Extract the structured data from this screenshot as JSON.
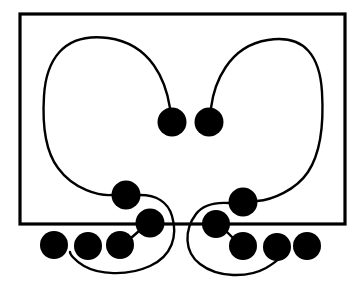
{
  "figure": {
    "title": "Mirrored curve and node diagram",
    "canvas": {
      "width": 364,
      "height": 285
    },
    "colors": {
      "background": "#ffffff",
      "ink": "#000000",
      "frame": "#000000",
      "node_fill": "#000000",
      "curve_stroke": "#000000"
    },
    "frame": {
      "name": "outer-rectangle",
      "x": 20,
      "y": 14,
      "width": 325,
      "height": 210,
      "stroke_width": 3.2
    },
    "style": {
      "curve_stroke_width": 2.4,
      "connector_stroke_width": 2.4,
      "node_radius": 14,
      "small_node_radius": 13.5
    },
    "nodes": [
      {
        "id": "n1",
        "name": "center-left-node",
        "cx": 172,
        "cy": 122,
        "r": 14.5
      },
      {
        "id": "n2",
        "name": "center-right-node",
        "cx": 209,
        "cy": 122,
        "r": 14.5
      },
      {
        "id": "n3",
        "name": "left-mid-node",
        "cx": 126,
        "cy": 195,
        "r": 14.5
      },
      {
        "id": "n4",
        "name": "left-inner-node",
        "cx": 150,
        "cy": 223,
        "r": 14.5
      },
      {
        "id": "n5",
        "name": "left-bottom-node-c",
        "cx": 120,
        "cy": 245,
        "r": 14.0
      },
      {
        "id": "n6",
        "name": "left-bottom-node-b",
        "cx": 88,
        "cy": 246,
        "r": 14.0
      },
      {
        "id": "n7",
        "name": "left-bottom-node-a",
        "cx": 54,
        "cy": 245,
        "r": 14.0
      },
      {
        "id": "n8",
        "name": "right-mid-node",
        "cx": 243,
        "cy": 202,
        "r": 14.5
      },
      {
        "id": "n9",
        "name": "right-inner-node",
        "cx": 216,
        "cy": 224,
        "r": 14.0
      },
      {
        "id": "n10",
        "name": "right-bottom-node-a",
        "cx": 243,
        "cy": 246,
        "r": 14.0
      },
      {
        "id": "n11",
        "name": "right-bottom-node-b",
        "cx": 277,
        "cy": 247,
        "r": 14.0
      },
      {
        "id": "n12",
        "name": "right-bottom-node-c",
        "cx": 307,
        "cy": 246,
        "r": 14.0
      }
    ],
    "paths": [
      {
        "id": "p-left-main",
        "name": "left-main-curve",
        "d": "M 170 108 C 166 82 152 44 108 38 C 62 32 46 62 44 96 C 42 128 46 152 58 168 C 74 190 100 196 112 195"
      },
      {
        "id": "p-left-lower",
        "name": "left-lower-loop-curve",
        "d": "M 140 195 C 156 195 168 202 172 216 C 178 236 172 256 150 266 C 126 277 98 274 84 266 C 74 260 70 254 70 252"
      },
      {
        "id": "p-left-connector",
        "name": "left-node-connector",
        "d": "M 139 231 L 131 238"
      },
      {
        "id": "p-right-main",
        "name": "right-main-curve",
        "d": "M 211 108 C 214 84 228 46 268 40 C 306 34 320 58 322 92 C 324 126 320 154 308 172 C 296 190 272 200 257 201"
      },
      {
        "id": "p-right-lower",
        "name": "right-lower-loop-curve",
        "d": "M 229 203 C 214 202 202 206 196 214 C 184 230 184 252 200 264 C 218 278 248 278 266 268 C 276 262 280 258 281 257"
      },
      {
        "id": "p-right-connector",
        "name": "right-node-connector",
        "d": "M 227 232 L 233 238"
      }
    ]
  }
}
